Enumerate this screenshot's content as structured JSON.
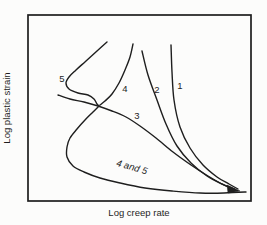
{
  "figure": {
    "background": "#fcfcfb",
    "ink": "#1e1e1e"
  },
  "chart_data": {
    "type": "line",
    "title": "",
    "xlabel": "Log creep rate",
    "ylabel": "Log plastic strain",
    "axis_style": "qualitative sketch, no tick marks or numeric scales, closed rectangular frame",
    "legend": "curves labeled in-plot: 1, 2, 3, 4, 5, and merged branch '4 and 5'",
    "frame_px": {
      "left": 28,
      "top": 15,
      "right": 251,
      "bottom": 201
    },
    "series": [
      {
        "name": "1",
        "points_px": [
          [
            171,
            45
          ],
          [
            172,
            72
          ],
          [
            174,
            100
          ],
          [
            180,
            127
          ],
          [
            190,
            148
          ],
          [
            203,
            165
          ],
          [
            217,
            177
          ],
          [
            229,
            184
          ],
          [
            238,
            189
          ]
        ]
      },
      {
        "name": "2",
        "points_px": [
          [
            142,
            51
          ],
          [
            148,
            75
          ],
          [
            157,
            100
          ],
          [
            166,
            124
          ],
          [
            177,
            146
          ],
          [
            191,
            163
          ],
          [
            207,
            176
          ],
          [
            222,
            184
          ],
          [
            234,
            189
          ]
        ]
      },
      {
        "name": "3",
        "points_px": [
          [
            58,
            95
          ],
          [
            70,
            99
          ],
          [
            84,
            102
          ],
          [
            98,
            106
          ],
          [
            112,
            111
          ],
          [
            126,
            117
          ],
          [
            140,
            126
          ],
          [
            156,
            138
          ],
          [
            173,
            152
          ],
          [
            191,
            165
          ],
          [
            208,
            176
          ],
          [
            222,
            184
          ],
          [
            234,
            189
          ]
        ]
      },
      {
        "name": "4",
        "points_px": [
          [
            133,
            44
          ],
          [
            130,
            57
          ],
          [
            125,
            70
          ],
          [
            119,
            83
          ],
          [
            112,
            94
          ],
          [
            105,
            101
          ],
          [
            100,
            105
          ]
        ]
      },
      {
        "name": "5",
        "points_px": [
          [
            107,
            42
          ],
          [
            97,
            51
          ],
          [
            86,
            61
          ],
          [
            76,
            70
          ],
          [
            69,
            77
          ],
          [
            66,
            83
          ],
          [
            69,
            89
          ],
          [
            78,
            93
          ],
          [
            88,
            95
          ],
          [
            94,
            99
          ],
          [
            97,
            104
          ],
          [
            99,
            106
          ]
        ]
      },
      {
        "name": "4 and 5 (merged continuation)",
        "points_px": [
          [
            99,
            106
          ],
          [
            93,
            112
          ],
          [
            85,
            120
          ],
          [
            77,
            129
          ],
          [
            70,
            138
          ],
          [
            67,
            147
          ],
          [
            67,
            157
          ],
          [
            73,
            166
          ],
          [
            84,
            172
          ],
          [
            100,
            178
          ],
          [
            120,
            183
          ],
          [
            145,
            188
          ],
          [
            172,
            191
          ],
          [
            200,
            193
          ],
          [
            224,
            193
          ],
          [
            246,
            192
          ]
        ]
      }
    ],
    "convergence_arrow_px": {
      "tip": [
        240,
        191
      ],
      "base": [
        [
          227,
          185
        ],
        [
          228,
          193
        ]
      ]
    },
    "curve_labels": [
      {
        "text": "5",
        "x": 62,
        "y": 82,
        "italic": false,
        "rotate": 0
      },
      {
        "text": "4",
        "x": 125,
        "y": 92,
        "italic": false,
        "rotate": 0
      },
      {
        "text": "2",
        "x": 157,
        "y": 93,
        "italic": false,
        "rotate": 0
      },
      {
        "text": "1",
        "x": 180,
        "y": 89,
        "italic": false,
        "rotate": 0
      },
      {
        "text": "3",
        "x": 137,
        "y": 119,
        "italic": false,
        "rotate": 0
      },
      {
        "text": "4 and 5",
        "x": 131,
        "y": 170,
        "italic": true,
        "rotate": 16
      }
    ]
  }
}
